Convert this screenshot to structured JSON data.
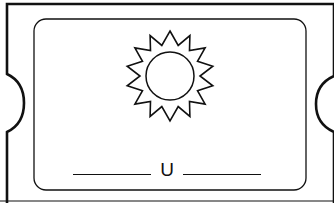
{
  "card": {
    "picture": "sun-icon",
    "word_pattern": [
      "_",
      "u",
      "_"
    ],
    "given_letter": "U",
    "blank_count": 2
  },
  "colors": {
    "ink": "#111111",
    "background": "#ffffff"
  }
}
